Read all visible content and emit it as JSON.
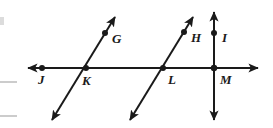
{
  "figure": {
    "type": "geometry-diagram",
    "background_color": "#ffffff",
    "stroke_color": "#1a1a1a",
    "artifact_color": "#c9c9c9",
    "labels": {
      "g": "G",
      "h": "H",
      "i": "I",
      "j": "J",
      "k": "K",
      "l": "L",
      "m": "M"
    },
    "points": {
      "g": {
        "x": 105,
        "y": 33
      },
      "h": {
        "x": 184,
        "y": 32
      },
      "i": {
        "x": 214,
        "y": 33
      },
      "j": {
        "x": 42,
        "y": 68
      },
      "k": {
        "x": 86,
        "y": 68
      },
      "l": {
        "x": 163,
        "y": 68
      },
      "m": {
        "x": 214,
        "y": 68
      }
    },
    "label_positions": {
      "g": {
        "x": 112,
        "y": 43
      },
      "h": {
        "x": 191,
        "y": 42
      },
      "i": {
        "x": 222,
        "y": 42
      },
      "j": {
        "x": 39,
        "y": 84
      },
      "k": {
        "x": 83,
        "y": 85
      },
      "l": {
        "x": 169,
        "y": 84
      },
      "m": {
        "x": 221,
        "y": 84
      }
    },
    "lines": [
      {
        "name": "horizontal-line-jm",
        "kind": "double-arrow",
        "x1": 28,
        "y1": 68,
        "x2": 258,
        "y2": 68
      },
      {
        "name": "transversal-line-kg",
        "kind": "double-arrow",
        "x1": 52,
        "y1": 120,
        "x2": 115,
        "y2": 17
      },
      {
        "name": "transversal-line-lh",
        "kind": "double-arrow",
        "x1": 130,
        "y1": 120,
        "x2": 193,
        "y2": 17
      },
      {
        "name": "vertical-line-im",
        "kind": "double-arrow",
        "x1": 214,
        "y1": 120,
        "x2": 214,
        "y2": 12
      }
    ],
    "edge_artifacts": [
      {
        "name": "margin-rule-top",
        "x": 0,
        "y": 17,
        "w": 4,
        "h": 8
      },
      {
        "name": "margin-rule-middle",
        "x": 0,
        "y": 81,
        "w": 17,
        "h": 2
      },
      {
        "name": "margin-rule-bottom",
        "x": 0,
        "y": 115,
        "w": 17,
        "h": 2
      }
    ]
  }
}
